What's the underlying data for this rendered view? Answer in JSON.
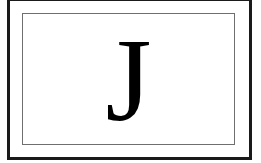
{
  "card": {
    "letter": "J",
    "colors": {
      "outer_border": "#1a1a1a",
      "inner_border": "#6f6f6f",
      "background": "#ffffff",
      "letter": "#000000"
    }
  }
}
